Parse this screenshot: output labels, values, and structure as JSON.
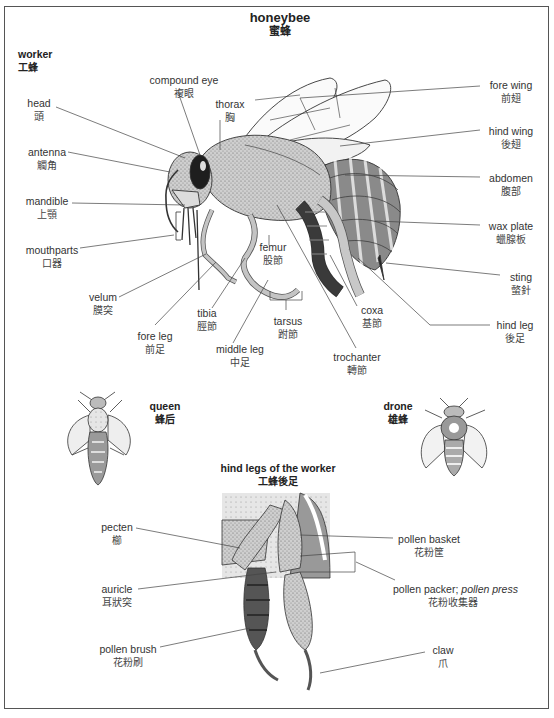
{
  "title": {
    "en": "honeybee",
    "zh": "蜜蜂"
  },
  "worker_section": {
    "heading": {
      "en": "worker",
      "zh": "工蜂"
    },
    "labels": [
      {
        "id": "compound-eye",
        "en": "compound eye",
        "zh": "複眼"
      },
      {
        "id": "thorax",
        "en": "thorax",
        "zh": "胸"
      },
      {
        "id": "head",
        "en": "head",
        "zh": "頭"
      },
      {
        "id": "antenna",
        "en": "antenna",
        "zh": "觸角"
      },
      {
        "id": "mandible",
        "en": "mandible",
        "zh": "上顎"
      },
      {
        "id": "mouthparts",
        "en": "mouthparts",
        "zh": "口器"
      },
      {
        "id": "velum",
        "en": "velum",
        "zh": "膜突"
      },
      {
        "id": "fore-leg",
        "en": "fore leg",
        "zh": "前足"
      },
      {
        "id": "tibia",
        "en": "tibia",
        "zh": "脛節"
      },
      {
        "id": "middle-leg",
        "en": "middle leg",
        "zh": "中足"
      },
      {
        "id": "femur",
        "en": "femur",
        "zh": "股節"
      },
      {
        "id": "tarsus",
        "en": "tarsus",
        "zh": "跗節"
      },
      {
        "id": "trochanter",
        "en": "trochanter",
        "zh": "轉節"
      },
      {
        "id": "coxa",
        "en": "coxa",
        "zh": "基節"
      },
      {
        "id": "fore-wing",
        "en": "fore wing",
        "zh": "前翅"
      },
      {
        "id": "hind-wing",
        "en": "hind wing",
        "zh": "後翅"
      },
      {
        "id": "abdomen",
        "en": "abdomen",
        "zh": "腹部"
      },
      {
        "id": "wax-plate",
        "en": "wax plate",
        "zh": "蠟腺板"
      },
      {
        "id": "sting",
        "en": "sting",
        "zh": "螫針"
      },
      {
        "id": "hind-leg",
        "en": "hind leg",
        "zh": "後足"
      }
    ]
  },
  "queen": {
    "en": "queen",
    "zh": "蜂后"
  },
  "drone": {
    "en": "drone",
    "zh": "雄蜂"
  },
  "hind_legs_section": {
    "heading": {
      "en": "hind legs of the worker",
      "zh": "工蜂後足"
    },
    "labels": [
      {
        "id": "pecten",
        "en": "pecten",
        "zh": "櫛"
      },
      {
        "id": "auricle",
        "en": "auricle",
        "zh": "耳狀突"
      },
      {
        "id": "pollen-brush",
        "en": "pollen brush",
        "zh": "花粉刷"
      },
      {
        "id": "pollen-basket",
        "en": "pollen basket",
        "zh": "花粉筐"
      },
      {
        "id": "pollen-packer",
        "en": "pollen packer; ",
        "en_italic": "pollen press",
        "zh": "花粉收集器"
      },
      {
        "id": "claw",
        "en": "claw",
        "zh": "爪"
      }
    ]
  },
  "colors": {
    "frame": "#555555",
    "line": "#444444",
    "body_fill": "#c8c8c8",
    "dark_fill": "#3a3a3a",
    "abdomen_fill": "#8a8a8a"
  }
}
